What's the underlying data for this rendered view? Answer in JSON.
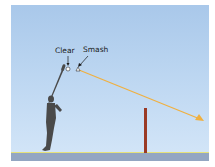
{
  "diagram": {
    "labels": {
      "clear": "Clear",
      "smash": "Smash"
    },
    "colors": {
      "sky_top": "#a9c8ea",
      "sky_bottom": "#d4e6f8",
      "ground": "#93a6c2",
      "ground_line": "#e6e27a",
      "trajectory": "#f0b040",
      "net_post": "#9a3a25",
      "player": "#4a4a4a"
    }
  }
}
